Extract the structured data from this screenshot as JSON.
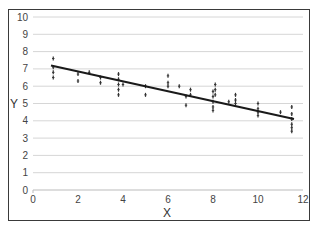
{
  "chart_data": {
    "type": "scatter",
    "title": "",
    "xlabel": "X",
    "ylabel": "Y",
    "xlim": [
      0,
      12
    ],
    "ylim": [
      0,
      10
    ],
    "xticks": [
      0,
      2,
      4,
      6,
      8,
      10,
      12
    ],
    "yticks": [
      0,
      1,
      2,
      3,
      4,
      5,
      6,
      7,
      8,
      9,
      10
    ],
    "grid": {
      "horizontal": true,
      "vertical": false
    },
    "legend": null,
    "series": [
      {
        "name": "observations",
        "x": [
          0.9,
          0.9,
          0.9,
          0.9,
          2.0,
          2.0,
          2.5,
          3.0,
          3.0,
          3.8,
          3.8,
          3.8,
          3.8,
          3.8,
          4.0,
          5.0,
          5.0,
          6.0,
          6.0,
          6.0,
          6.5,
          6.8,
          6.8,
          7.0,
          7.0,
          8.0,
          8.0,
          8.0,
          8.0,
          8.0,
          8.1,
          8.1,
          8.1,
          8.7,
          9.0,
          9.0,
          9.0,
          10.0,
          10.0,
          10.0,
          10.0,
          11.0,
          11.5,
          11.5,
          11.5,
          11.5,
          11.5,
          11.5
        ],
        "y": [
          7.6,
          7.1,
          6.8,
          6.5,
          6.7,
          6.3,
          6.8,
          6.5,
          6.2,
          6.7,
          6.4,
          6.1,
          5.8,
          5.5,
          6.1,
          6.0,
          5.5,
          6.6,
          6.2,
          6.0,
          6.0,
          5.4,
          4.9,
          5.8,
          5.5,
          5.7,
          5.4,
          5.1,
          4.8,
          4.6,
          6.1,
          5.8,
          5.5,
          5.1,
          5.5,
          5.2,
          5.0,
          5.0,
          4.7,
          4.5,
          4.3,
          4.5,
          4.8,
          4.4,
          4.1,
          3.8,
          3.6,
          3.4
        ],
        "marker": "small-dash",
        "color": "#333333"
      },
      {
        "name": "linear fit",
        "type": "line",
        "x": [
          0.8,
          11.6
        ],
        "y": [
          7.2,
          4.1
        ],
        "color": "#1a1a1a"
      }
    ]
  }
}
